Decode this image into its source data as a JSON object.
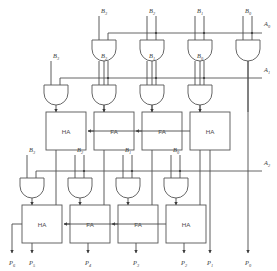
{
  "diagram": {
    "colors": {
      "wire": "#4a4a4a",
      "outline": "#555555",
      "text": "#3d3d3d",
      "background": "#ffffff"
    }
  },
  "inputs": {
    "b_rows": [
      {
        "row": 0,
        "labels": [
          "B",
          "B",
          "B",
          "B"
        ],
        "subs": [
          "3",
          "2",
          "1",
          "0"
        ]
      },
      {
        "row": 1,
        "labels": [
          "B",
          "B",
          "B",
          "B"
        ],
        "subs": [
          "3",
          "2",
          "1",
          "0"
        ]
      },
      {
        "row": 2,
        "labels": [
          "B",
          "B",
          "B",
          "B"
        ],
        "subs": [
          "3",
          "2",
          "1",
          "0"
        ]
      }
    ],
    "a_lines": [
      {
        "label": "A",
        "sub": "0"
      },
      {
        "label": "A",
        "sub": "1"
      },
      {
        "label": "A",
        "sub": "2"
      }
    ]
  },
  "adders": {
    "row1": [
      {
        "type": "HA"
      },
      {
        "type": "FA"
      },
      {
        "type": "FA"
      },
      {
        "type": "HA"
      }
    ],
    "row2": [
      {
        "type": "HA"
      },
      {
        "type": "FA"
      },
      {
        "type": "FA"
      },
      {
        "type": "HA"
      }
    ]
  },
  "outputs": [
    {
      "label": "P",
      "sub": "6"
    },
    {
      "label": "P",
      "sub": "5"
    },
    {
      "label": "P",
      "sub": "4"
    },
    {
      "label": "P",
      "sub": "3"
    },
    {
      "label": "P",
      "sub": "2"
    },
    {
      "label": "P",
      "sub": "1"
    },
    {
      "label": "P",
      "sub": "0"
    }
  ],
  "gates": {
    "type": "AND",
    "rows": 3,
    "per_row": 4,
    "total": 12
  }
}
